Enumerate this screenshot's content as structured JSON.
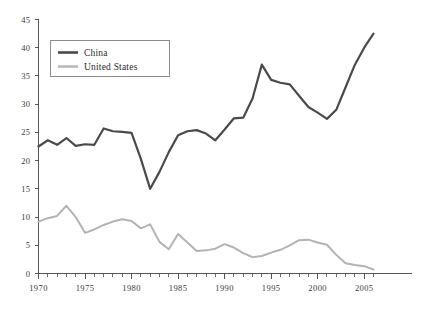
{
  "chart_data": {
    "type": "line",
    "title": "",
    "subtitle": "",
    "xlabel": "",
    "ylabel": "",
    "xlim": [
      1970,
      2006
    ],
    "ylim": [
      0,
      45
    ],
    "grid": false,
    "legend_position": "top-left",
    "x": [
      1970,
      1971,
      1972,
      1973,
      1974,
      1975,
      1976,
      1977,
      1978,
      1979,
      1980,
      1981,
      1982,
      1983,
      1984,
      1985,
      1986,
      1987,
      1988,
      1989,
      1990,
      1991,
      1992,
      1993,
      1994,
      1995,
      1996,
      1997,
      1998,
      1999,
      2000,
      2001,
      2002,
      2003,
      2004,
      2005,
      2006
    ],
    "x_tick_labels": [
      "1970",
      "1975",
      "1980",
      "1985",
      "1990",
      "1995",
      "2000",
      "2005"
    ],
    "x_ticks": [
      1970,
      1975,
      1980,
      1985,
      1990,
      1995,
      2000,
      2005
    ],
    "y_tick_labels": [
      "0",
      "5",
      "10",
      "15",
      "20",
      "25",
      "30",
      "35",
      "40",
      "45"
    ],
    "y_ticks": [
      0,
      5,
      10,
      15,
      20,
      25,
      30,
      35,
      40,
      45
    ],
    "series": [
      {
        "name": "China",
        "color": "#4a4a4a",
        "width": 2.2,
        "values": [
          22.5,
          23.6,
          22.8,
          24.0,
          22.6,
          22.9,
          22.8,
          25.7,
          25.2,
          25.1,
          24.9,
          20.3,
          15.0,
          18.0,
          21.5,
          24.5,
          25.2,
          25.4,
          24.8,
          23.6,
          25.5,
          27.5,
          27.6,
          31.0,
          37.0,
          34.3,
          33.8,
          33.5,
          31.5,
          29.5,
          28.5,
          27.4,
          29.0,
          33.0,
          37.0,
          40.0,
          42.5
        ]
      },
      {
        "name": "United States",
        "color": "#b3b3b3",
        "width": 2.0,
        "values": [
          9.2,
          9.8,
          10.2,
          12.0,
          10.0,
          7.2,
          7.8,
          8.6,
          9.2,
          9.6,
          9.3,
          8.0,
          8.7,
          5.6,
          4.3,
          7.0,
          5.5,
          4.0,
          4.1,
          4.4,
          5.2,
          4.6,
          3.6,
          2.9,
          3.1,
          3.7,
          4.2,
          5.0,
          5.9,
          6.0,
          5.5,
          5.1,
          3.3,
          1.8,
          1.5,
          1.3,
          0.7
        ]
      }
    ]
  },
  "legend": {
    "entries": [
      {
        "label": "China",
        "color": "#4a4a4a"
      },
      {
        "label": "United States",
        "color": "#b3b3b3"
      }
    ]
  },
  "axes": {
    "y_labels": [
      "45",
      "40",
      "35",
      "30",
      "25",
      "20",
      "15",
      "10",
      "5",
      "0"
    ],
    "x_labels": [
      "1970",
      "1975",
      "1980",
      "1985",
      "1990",
      "1995",
      "2000",
      "2005"
    ]
  }
}
